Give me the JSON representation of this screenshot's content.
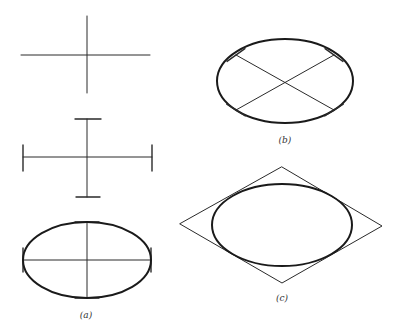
{
  "figure": {
    "colors": {
      "ink": "#1a1a1a",
      "background": "#ffffff"
    },
    "panels": [
      {
        "id": "a",
        "label": "(a)",
        "label_pos": [
          86,
          318
        ],
        "steps": [
          {
            "name": "axes-cross",
            "vertical": [
              87,
              16,
              87,
              93
            ],
            "horizontal": [
              21,
              55,
              150,
              55
            ]
          },
          {
            "name": "axes-with-end-marks",
            "vertical": [
              87,
              119,
              87,
              197
            ],
            "horizontal": [
              23,
              157,
              152,
              157
            ],
            "end_marks": {
              "top": [
                75,
                119,
                101,
                119
              ],
              "bottom": [
                76,
                197,
                100,
                197
              ],
              "left": [
                23,
                145,
                23,
                171
              ],
              "right": [
                152,
                145,
                152,
                171
              ]
            }
          },
          {
            "name": "ellipse-on-axes",
            "center": [
              87,
              260
            ],
            "rx": 64,
            "ry": 38
          }
        ]
      },
      {
        "id": "b",
        "label": "(b)",
        "label_pos": [
          285,
          143
        ],
        "ellipse": {
          "center": [
            285,
            81
          ],
          "rx": 68,
          "ry": 42
        },
        "diagonals": [
          [
            236,
            55,
            334,
            110
          ],
          [
            334,
            55,
            236,
            110
          ]
        ]
      },
      {
        "id": "c",
        "label": "(c)",
        "label_pos": [
          282,
          301
        ],
        "rhombus": [
          [
            282,
            167
          ],
          [
            382,
            226
          ],
          [
            282,
            283
          ],
          [
            180,
            224
          ]
        ],
        "ellipse": {
          "center": [
            282,
            225
          ],
          "rx": 70,
          "ry": 41
        }
      }
    ]
  }
}
